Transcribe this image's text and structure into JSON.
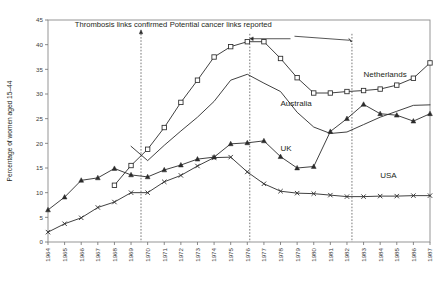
{
  "chart_data": {
    "type": "line",
    "title": "",
    "xlabel": "",
    "ylabel": "Percentage of women aged 15–44",
    "xlim": [
      1964,
      1987
    ],
    "ylim": [
      0,
      45
    ],
    "yticks": [
      0,
      5,
      10,
      15,
      20,
      25,
      30,
      35,
      40,
      45
    ],
    "grid": false,
    "legend_position": "inline-labels",
    "x": [
      1964,
      1965,
      1966,
      1967,
      1968,
      1969,
      1970,
      1971,
      1972,
      1973,
      1974,
      1975,
      1976,
      1977,
      1978,
      1979,
      1980,
      1981,
      1982,
      1983,
      1984,
      1985,
      1986,
      1987
    ],
    "categories": [
      "1964",
      "1965",
      "1966",
      "1967",
      "1968",
      "1969",
      "1970",
      "1971",
      "1972",
      "1973",
      "1974",
      "1975",
      "1976",
      "1977",
      "1978",
      "1979",
      "1980",
      "1981",
      "1982",
      "1983",
      "1984",
      "1985",
      "1986",
      "1987"
    ],
    "series": [
      {
        "name": "Netherlands",
        "marker": "square",
        "label_position_year": 1983,
        "label_position_value": 33.5,
        "values": [
          null,
          null,
          null,
          null,
          11.5,
          15.5,
          18.8,
          23.2,
          28.3,
          32.8,
          37.5,
          39.6,
          40.6,
          40.6,
          37.2,
          33.3,
          30.2,
          30.2,
          30.5,
          30.7,
          31.0,
          31.8,
          33.2,
          36.3
        ]
      },
      {
        "name": "Australia",
        "marker": "none",
        "label_position_year": 1978,
        "label_position_value": 27.5,
        "values": [
          null,
          null,
          null,
          null,
          null,
          19.4,
          16.5,
          19.6,
          22.5,
          25.3,
          28.5,
          32.8,
          34.0,
          32.2,
          30.5,
          26.3,
          23.3,
          22.0,
          22.3,
          23.8,
          25.3,
          26.5,
          27.7,
          27.8
        ]
      },
      {
        "name": "UK",
        "marker": "triangle",
        "label_position_year": 1978,
        "label_position_value": 18.5,
        "values": [
          6.5,
          9.1,
          12.5,
          13.0,
          14.9,
          13.6,
          13.2,
          14.6,
          15.6,
          16.8,
          17.2,
          19.9,
          20.1,
          20.5,
          17.3,
          15.0,
          15.3,
          22.4,
          25.0,
          27.9,
          26.0,
          25.7,
          24.5,
          26.0
        ]
      },
      {
        "name": "USA",
        "marker": "x",
        "label_position_year": 1984,
        "label_position_value": 13.0,
        "values": [
          2.0,
          3.7,
          4.9,
          7.0,
          8.1,
          10.0,
          10.0,
          12.2,
          13.5,
          15.4,
          17.1,
          17.2,
          14.2,
          11.8,
          10.3,
          9.9,
          9.8,
          9.5,
          9.2,
          9.2,
          9.3,
          9.3,
          9.4,
          9.4
        ]
      }
    ],
    "annotations": [
      {
        "id": "thrombosis",
        "text": "Thrombosis links confirmed",
        "text_year": 1968.4,
        "text_value": 43.6,
        "event_years": [
          1969.6
        ],
        "arrow_from_year": 1969.6,
        "arrow_to_year": 1969.6
      },
      {
        "id": "cancer",
        "text": "Potential cancer links reported",
        "text_year": 1974.4,
        "text_value": 43.6,
        "event_years": [
          1976.15,
          1982.3
        ],
        "arrow_from_year": 1978.6,
        "arrow_to_year": 1976.15
      }
    ],
    "event_lines": [
      {
        "year": 1969.6,
        "top_value": 42.2,
        "bottom_value": 0
      },
      {
        "year": 1976.15,
        "top_value": 42.2,
        "bottom_value": 0
      },
      {
        "year": 1982.3,
        "top_value": 42.2,
        "bottom_value": 0
      }
    ]
  }
}
